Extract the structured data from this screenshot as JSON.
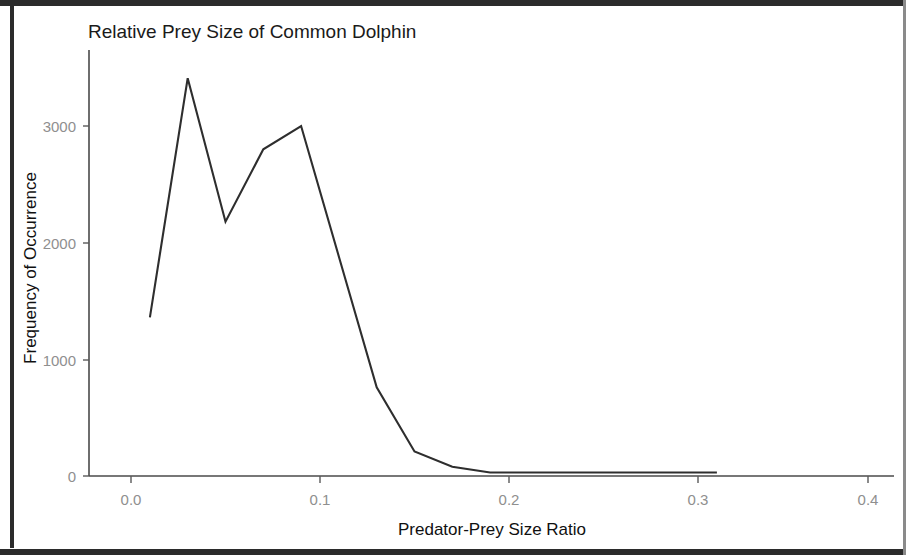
{
  "chart_data": {
    "type": "line",
    "title": "Relative Prey Size of Common Dolphin",
    "xlabel": "Predator-Prey Size Ratio",
    "ylabel": "Frequency of Occurrence",
    "xlim": [
      -0.0075,
      0.425
    ],
    "ylim": [
      -60,
      3550
    ],
    "xticks": [
      0.0,
      0.1,
      0.2,
      0.3,
      0.4
    ],
    "xticklabels": [
      "0.0",
      "0.1",
      "0.2",
      "0.3",
      "0.4"
    ],
    "yticks": [
      0,
      1000,
      2000,
      3000
    ],
    "yticklabels": [
      "0",
      "1000",
      "2000",
      "3000"
    ],
    "grid": false,
    "legend": false,
    "series": [
      {
        "name": "Common Dolphin",
        "color": "#2e2e2e",
        "x": [
          0.01,
          0.03,
          0.05,
          0.07,
          0.09,
          0.11,
          0.13,
          0.15,
          0.17,
          0.19,
          0.31
        ],
        "y": [
          1360,
          3410,
          2180,
          2800,
          3000,
          1880,
          760,
          210,
          80,
          30,
          30
        ]
      }
    ]
  },
  "axes": {
    "title": "Relative Prey Size of Common Dolphin",
    "x_axis_title": "Predator-Prey Size Ratio",
    "y_axis_title": "Frequency of Occurrence",
    "x_tick_labels": [
      "0.0",
      "0.1",
      "0.2",
      "0.3",
      "0.4"
    ],
    "y_tick_labels": [
      "3000",
      "2000",
      "1000",
      "0"
    ]
  },
  "colors": {
    "line": "#2e2e2e",
    "axis": "#4a4a4a",
    "tick_text": "#8f8f8f",
    "title_text": "#1a1a1a",
    "background": "#ffffff",
    "frame": "#2b2b2b"
  }
}
